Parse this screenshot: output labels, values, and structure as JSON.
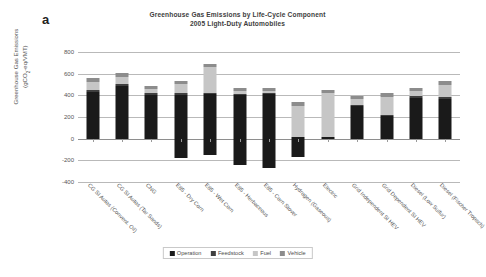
{
  "figure": {
    "panel_label": "a"
  },
  "chart_data": {
    "type": "bar",
    "subtype": "stacked-bar",
    "title": "Greenhouse Gas Emissions by Life-Cycle Component",
    "subtitle": "2005 Light-Duty Automobiles",
    "xlabel": "",
    "ylabel_line1": "Greenhouse Gas Emissions",
    "ylabel_line2": "(gCO2-eq/VMT)",
    "ylim": [
      -400,
      800
    ],
    "yticks": [
      800,
      600,
      400,
      200,
      0,
      -200,
      -400
    ],
    "ytick_labels": [
      "800",
      "600",
      "400",
      "200",
      "0",
      "-200",
      "-400"
    ],
    "grid": true,
    "legend_position": "bottom",
    "categories": [
      "CG SI Autos (Convent. Oil)",
      "CG SI Autos (Tar Sands)",
      "CNG",
      "E85 - Dry Corn",
      "E85 - Wet Corn",
      "E85 - Herbaceous",
      "E85 - Corn Stover",
      "Hydrogen (Gaseous)",
      "Electric",
      "Grid Independent SI HEV",
      "Grid Dependent SI HEV",
      "Diesel (Low Sulfur)",
      "Diesel (Fischer Tropsch)"
    ],
    "series": [
      {
        "name": "Operation",
        "color": "#1a1a1a",
        "values": [
          430,
          487,
          405,
          405,
          408,
          405,
          408,
          18,
          18,
          297,
          213,
          377,
          370
        ]
      },
      {
        "name": "Feedstock",
        "color": "#3f3f3f",
        "values": [
          18,
          22,
          12,
          12,
          10,
          10,
          10,
          0,
          0,
          10,
          8,
          14,
          14
        ]
      },
      {
        "name": "Fuel",
        "color": "#c6c6c6",
        "values": [
          75,
          60,
          40,
          85,
          245,
          25,
          22,
          285,
          400,
          55,
          165,
          48,
          110
        ]
      },
      {
        "name": "Vehicle",
        "color": "#8c8c8c",
        "values": [
          37,
          33,
          30,
          30,
          25,
          25,
          25,
          32,
          32,
          35,
          32,
          33,
          35
        ]
      },
      {
        "name": "Feedstock (credit)",
        "color": "#1a1a1a",
        "values": [
          0,
          0,
          0,
          -178,
          -148,
          -245,
          -272,
          -172,
          0,
          0,
          0,
          0,
          0
        ]
      }
    ],
    "legend": [
      {
        "label": "Operation",
        "color": "#1a1a1a"
      },
      {
        "label": "Feedstock",
        "color": "#3f3f3f"
      },
      {
        "label": "Fuel",
        "color": "#c6c6c6"
      },
      {
        "label": "Vehicle",
        "color": "#8c8c8c"
      }
    ]
  }
}
